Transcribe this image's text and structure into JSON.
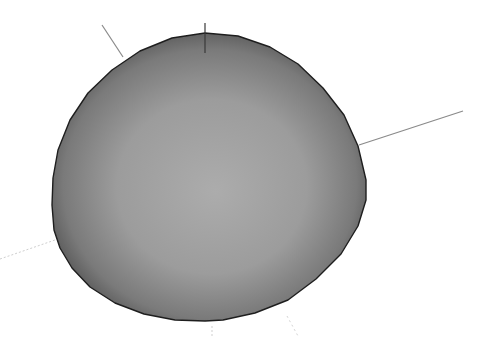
{
  "viewport": {
    "background": "#ffffff",
    "model": {
      "type": "sphere",
      "fill_center": "#a9a9a9",
      "fill_edge": "#5a5a5a",
      "outline": "#1e1e1e"
    },
    "axes": {
      "line_color": "#8a8a8a",
      "vertical_color": "#3a3a3a",
      "hidden_color": "#c8c8c8"
    }
  }
}
